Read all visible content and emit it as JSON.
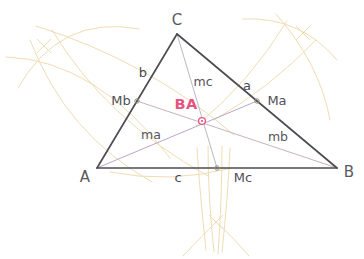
{
  "figure": {
    "type": "geometry-construction",
    "width": 364,
    "height": 259,
    "background_color": "#ffffff"
  },
  "colors": {
    "triangle_edge": "#4d4d52",
    "median_a": "#b9a6c8",
    "median_b": "#c9b2bd",
    "median_c": "#b9b9c2",
    "construction_arc": "#f0dcb4",
    "centroid_marker": "#e8537f",
    "centroid_label": "#e8537f",
    "midpoint_marker": "#9a8f7a",
    "vertex_label": "#5a5a5f"
  },
  "vertices": [
    {
      "name": "A",
      "label": "A",
      "x": 97,
      "y": 168,
      "label_x": 85,
      "label_y": 177
    },
    {
      "name": "B",
      "label": "B",
      "x": 337,
      "y": 168,
      "label_x": 349,
      "label_y": 172
    },
    {
      "name": "C",
      "label": "C",
      "x": 177,
      "y": 34,
      "label_x": 177,
      "label_y": 20
    }
  ],
  "midpoints": [
    {
      "name": "Ma",
      "label": "Ma",
      "on_side": "BC",
      "x": 257,
      "y": 101,
      "label_x": 277,
      "label_y": 100
    },
    {
      "name": "Mb",
      "label": "Mb",
      "on_side": "AC",
      "x": 137,
      "y": 101,
      "label_x": 121,
      "label_y": 100
    },
    {
      "name": "Mc",
      "label": "Mc",
      "on_side": "AB",
      "x": 217,
      "y": 168,
      "label_x": 243,
      "label_y": 177
    }
  ],
  "centroid": {
    "name": "BA",
    "label": "BA",
    "x": 202,
    "y": 121,
    "label_x": 186,
    "label_y": 104,
    "marker_radius": 3.4
  },
  "sides": [
    {
      "name": "a",
      "label": "a",
      "from": "C",
      "to": "B",
      "label_x": 247,
      "label_y": 85
    },
    {
      "name": "b",
      "label": "b",
      "from": "A",
      "to": "C",
      "label_x": 143,
      "label_y": 72
    },
    {
      "name": "c",
      "label": "c",
      "from": "A",
      "to": "B",
      "label_x": 178,
      "label_y": 177
    }
  ],
  "medians": [
    {
      "name": "ma",
      "label": "ma",
      "from": "A",
      "to": "Ma",
      "label_x": 151,
      "label_y": 135
    },
    {
      "name": "mb",
      "label": "mb",
      "from": "B",
      "to": "Mb",
      "label_x": 278,
      "label_y": 137
    },
    {
      "name": "mc",
      "label": "mc",
      "from": "C",
      "to": "Mc",
      "label_x": 203,
      "label_y": 82
    }
  ],
  "construction": {
    "description": "compass arcs for perpendicular bisectors of each side",
    "intersections": [
      {
        "name": "arc-node-left",
        "x": 44,
        "y": 46
      },
      {
        "name": "arc-node-right",
        "x": 303,
        "y": 33
      },
      {
        "name": "arc-node-bottom",
        "x": 216,
        "y": 222
      }
    ],
    "arcs": [
      {
        "name": "arc-ab-upper-left",
        "d": "M 18 88 Q 60 14 139 29"
      },
      {
        "name": "arc-ab-lower-left",
        "d": "M 6 57 Q 96 60 170 158"
      },
      {
        "name": "arc-ac-sweep-1",
        "d": "M 36 26 Q 150 62 234 135"
      },
      {
        "name": "arc-ac-sweep-2",
        "d": "M 30 40 Q 66 134 152 182"
      },
      {
        "name": "arc-left-long",
        "d": "M 52 30 Q 106 120 208 176"
      },
      {
        "name": "arc-right-upper",
        "d": "M 243 19 Q 300 16 337 60"
      },
      {
        "name": "arc-right-lower",
        "d": "M 276 14 Q 320 64 330 120"
      },
      {
        "name": "arc-right-sweep-1",
        "d": "M 287 21 Q 250 82 196 126"
      },
      {
        "name": "arc-right-sweep-2",
        "d": "M 316 40 Q 270 88 214 120"
      },
      {
        "name": "arc-bottom-left-1",
        "d": "M 197 148 Q 200 196 206 250"
      },
      {
        "name": "arc-bottom-left-2",
        "d": "M 208 146 Q 208 198 214 252"
      },
      {
        "name": "arc-bottom-right-1",
        "d": "M 230 148 Q 228 196 222 252"
      },
      {
        "name": "arc-bottom-right-2",
        "d": "M 222 146 Q 222 198 218 254"
      },
      {
        "name": "arc-bottom-flare-l",
        "d": "M 183 256 Q 206 232 216 222"
      },
      {
        "name": "arc-bottom-flare-r",
        "d": "M 249 256 Q 228 232 216 222"
      },
      {
        "name": "arc-mid-low-band",
        "d": "M 110 172 Q 170 184 232 168"
      }
    ]
  }
}
